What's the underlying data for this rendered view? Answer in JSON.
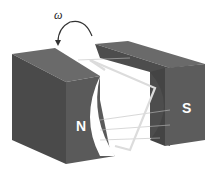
{
  "diagram": {
    "labels": {
      "north": "N",
      "south": "S",
      "angular_velocity": "ω"
    },
    "colors": {
      "magnet_dark": "#4a4a4a",
      "magnet_mid": "#5a5a5a",
      "magnet_face": "#555555",
      "coil": "#d8d8d8",
      "field_lines": "#bdbdbd",
      "background": "#ffffff"
    }
  }
}
